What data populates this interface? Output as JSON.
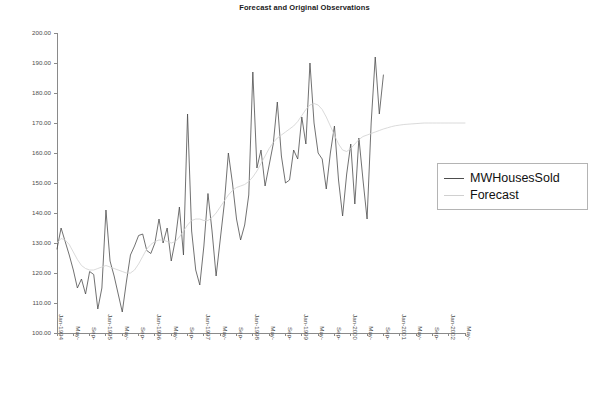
{
  "chart_data": {
    "type": "line",
    "title": "Forecast and Original Observations",
    "xlabel": "",
    "ylabel": "",
    "ylim": [
      100.0,
      200.0
    ],
    "ytick_step": 10.0,
    "ytick_labels": [
      "200.00",
      "190.00",
      "180.00",
      "170.00",
      "160.00",
      "150.00",
      "140.00",
      "130.00",
      "120.00",
      "110.00",
      "100.00"
    ],
    "grid": false,
    "legend_position": "right",
    "x_start": "Jan-1994",
    "x_end": "May-2002",
    "x_tick_interval_months": 4,
    "xtick_labels": [
      "Jan-1994",
      "May-",
      "Sep-",
      "Jan-1995",
      "May-",
      "Sep-",
      "Jan-1996",
      "May-",
      "Sep-",
      "Jan-1997",
      "May-",
      "Sep-",
      "Jan-1998",
      "May-",
      "Sep-",
      "Jan-1999",
      "May-",
      "Sep-",
      "Jan-2000",
      "May-",
      "Sep-",
      "Jan-2001",
      "May-",
      "Sep-",
      "Jan-2002",
      "May-"
    ],
    "series": [
      {
        "name": "MWHousesSold",
        "color": "#4d4d4d",
        "values": [
          128.0,
          135.0,
          130.5,
          126.0,
          121.0,
          115.0,
          118.0,
          113.0,
          120.5,
          119.5,
          108.0,
          115.0,
          141.0,
          124.0,
          119.0,
          113.0,
          107.0,
          117.0,
          126.0,
          129.0,
          132.5,
          133.0,
          127.5,
          126.5,
          130.0,
          138.0,
          130.0,
          135.0,
          124.0,
          131.0,
          142.0,
          126.0,
          173.0,
          134.0,
          121.0,
          116.0,
          129.0,
          146.5,
          134.0,
          119.0,
          131.0,
          143.0,
          160.0,
          150.0,
          138.0,
          131.0,
          136.0,
          146.0,
          187.0,
          155.0,
          161.0,
          149.0,
          156.0,
          163.0,
          177.0,
          159.0,
          150.0,
          151.0,
          161.0,
          158.0,
          172.0,
          163.0,
          190.0,
          170.0,
          160.0,
          158.0,
          148.0,
          160.0,
          169.0,
          151.0,
          139.0,
          153.0,
          163.0,
          143.0,
          165.0,
          151.0,
          138.0,
          170.0,
          192.0,
          173.0,
          186.0
        ]
      },
      {
        "name": "Forecast",
        "color": "#d0d0d0",
        "values": [
          130.0,
          131.5,
          131.0,
          129.5,
          127.0,
          124.5,
          122.5,
          121.5,
          121.0,
          121.0,
          121.5,
          122.0,
          122.5,
          122.0,
          121.5,
          121.0,
          120.5,
          120.0,
          120.0,
          121.0,
          123.0,
          125.5,
          128.0,
          129.5,
          130.5,
          131.0,
          131.0,
          130.5,
          130.0,
          130.5,
          132.0,
          134.0,
          136.0,
          137.5,
          138.0,
          138.0,
          137.5,
          137.5,
          138.5,
          140.0,
          142.0,
          144.0,
          146.0,
          147.5,
          148.5,
          149.0,
          149.5,
          150.5,
          152.0,
          154.0,
          156.5,
          159.0,
          161.5,
          163.5,
          165.0,
          166.0,
          167.0,
          168.0,
          169.0,
          170.5,
          172.5,
          174.5,
          176.0,
          176.5,
          176.0,
          174.5,
          172.0,
          169.0,
          166.0,
          163.0,
          161.0,
          160.5,
          161.5,
          163.0,
          164.5,
          165.5,
          166.0,
          166.5,
          167.0,
          167.5,
          168.0,
          168.4,
          168.8,
          169.1,
          169.3,
          169.5,
          169.6,
          169.7,
          169.8,
          169.9,
          170.0,
          170.0,
          170.0,
          170.0,
          170.0,
          170.0,
          170.0,
          170.0,
          170.0,
          170.0,
          170.0
        ]
      }
    ]
  },
  "legend": {
    "items": [
      {
        "label": "MWHousesSold",
        "color": "#4d4d4d"
      },
      {
        "label": "Forecast",
        "color": "#d0d0d0"
      }
    ]
  }
}
